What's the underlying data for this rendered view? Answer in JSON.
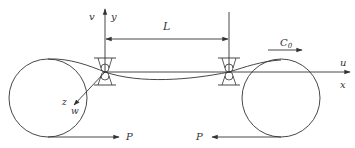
{
  "diagram": {
    "labels": {
      "v": "v",
      "y": "y",
      "L": "L",
      "C0_main": "C",
      "C0_sub": "0",
      "u": "u",
      "x": "x",
      "z": "z",
      "w": "w",
      "P_left": "P",
      "P_right": "P"
    },
    "elements": {
      "left_roller": {
        "cx": 48,
        "cy": 98,
        "r": 39
      },
      "right_roller": {
        "cx": 281,
        "cy": 98,
        "r": 39
      },
      "left_support_x": 105,
      "right_support_x": 229,
      "axis_y": 72,
      "span_label": "L",
      "velocity_label": "C0",
      "force_label": "P"
    },
    "colors": {
      "stroke": "#333333",
      "background": "#ffffff"
    }
  }
}
